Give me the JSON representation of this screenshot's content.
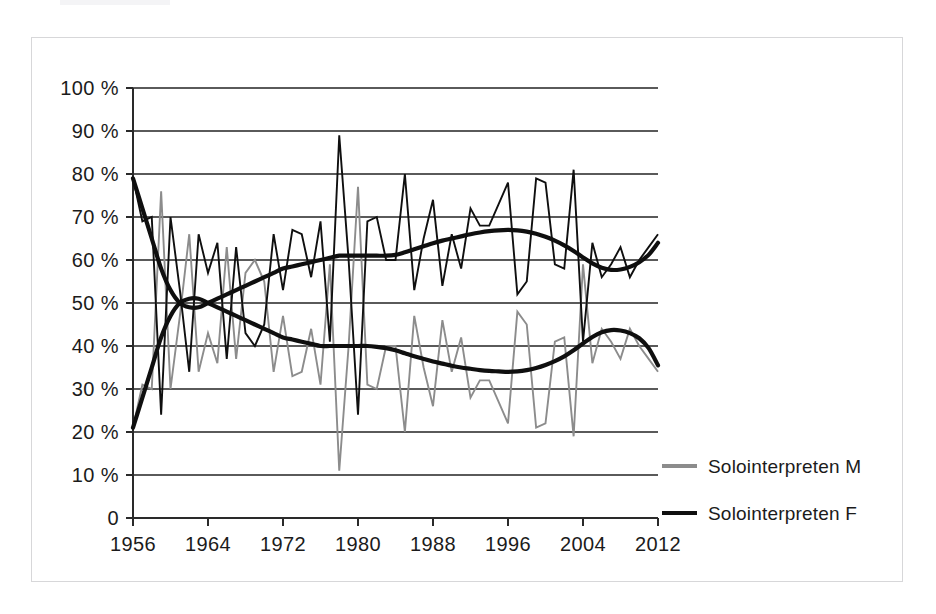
{
  "figure": {
    "kind": "line-chart",
    "background": "#ffffff",
    "frame_color": "#d7d7d9"
  },
  "chart_data": {
    "type": "line",
    "title": "",
    "subtitle": "",
    "xlabel": "",
    "ylabel": "",
    "xlim": [
      1956,
      2012
    ],
    "ylim": [
      0,
      100
    ],
    "grid": true,
    "legend_position": "right",
    "x_tick_labels": [
      "1956",
      "1964",
      "1972",
      "1980",
      "1988",
      "1996",
      "2004",
      "2012"
    ],
    "x_tick_values": [
      1956,
      1964,
      1972,
      1980,
      1988,
      1996,
      2004,
      2012
    ],
    "y_tick_labels": [
      "100 %",
      "90 %",
      "80 %",
      "70 %",
      "60 %",
      "50 %",
      "40 %",
      "30 %",
      "20 %",
      "10 %",
      "0"
    ],
    "y_tick_values": [
      100,
      90,
      80,
      70,
      60,
      50,
      40,
      30,
      20,
      10,
      0
    ],
    "x": [
      1956,
      1957,
      1958,
      1959,
      1960,
      1961,
      1962,
      1963,
      1964,
      1965,
      1966,
      1967,
      1968,
      1969,
      1970,
      1971,
      1972,
      1973,
      1974,
      1975,
      1976,
      1977,
      1978,
      1979,
      1980,
      1981,
      1982,
      1983,
      1984,
      1985,
      1986,
      1987,
      1988,
      1989,
      1990,
      1991,
      1992,
      1993,
      1994,
      1995,
      1996,
      1997,
      1998,
      1999,
      2000,
      2001,
      2002,
      2003,
      2004,
      2005,
      2006,
      2007,
      2008,
      2009,
      2010,
      2011,
      2012
    ],
    "series": [
      {
        "name": "Solointerpreten M",
        "color": "#8c8c8c",
        "style": "raw",
        "values": [
          21,
          31,
          30,
          76,
          30,
          47,
          66,
          34,
          43,
          36,
          63,
          37,
          57,
          60,
          55,
          34,
          47,
          33,
          34,
          44,
          31,
          59,
          11,
          40,
          77,
          31,
          30,
          40,
          40,
          20,
          47,
          35,
          26,
          46,
          34,
          42,
          28,
          32,
          32,
          27,
          22,
          48,
          45,
          21,
          22,
          41,
          42,
          19,
          59,
          36,
          44,
          41,
          37,
          44,
          40,
          37,
          34
        ]
      },
      {
        "name": "Solointerpreten F",
        "color": "#0f0f0f",
        "style": "raw",
        "values": [
          79,
          69,
          70,
          24,
          70,
          53,
          34,
          66,
          57,
          64,
          37,
          63,
          43,
          40,
          45,
          66,
          53,
          67,
          66,
          56,
          69,
          41,
          89,
          60,
          24,
          69,
          70,
          60,
          60,
          80,
          53,
          65,
          74,
          54,
          66,
          58,
          72,
          68,
          68,
          73,
          78,
          52,
          55,
          79,
          78,
          59,
          58,
          81,
          41,
          64,
          56,
          59,
          63,
          56,
          60,
          63,
          66
        ]
      },
      {
        "name": "Solointerpreten M trend",
        "color": "#0f0f0f",
        "style": "trend",
        "values": [
          21,
          28,
          35,
          42,
          47,
          50,
          51,
          51,
          50,
          49,
          48,
          47,
          46,
          45,
          44,
          43,
          42,
          41.5,
          41,
          40.5,
          40,
          40,
          40,
          40,
          40,
          40,
          39.8,
          39.5,
          39,
          38.3,
          37.6,
          37,
          36.4,
          35.9,
          35.4,
          35,
          34.7,
          34.4,
          34.2,
          34.1,
          34,
          34.1,
          34.4,
          34.9,
          35.6,
          36.5,
          37.6,
          39,
          40.6,
          42.1,
          43.2,
          43.7,
          43.6,
          43,
          41.8,
          39.5,
          35.5
        ]
      },
      {
        "name": "Solointerpreten F trend",
        "color": "#0f0f0f",
        "style": "trend",
        "values": [
          79,
          72,
          65,
          58,
          53,
          50,
          49,
          49,
          50,
          51,
          52,
          53,
          54,
          55,
          56,
          57,
          58,
          58.5,
          59,
          59.5,
          60,
          60.5,
          61,
          61,
          61,
          61,
          61,
          61,
          61.2,
          61.8,
          62.5,
          63.2,
          63.9,
          64.5,
          65,
          65.5,
          66,
          66.4,
          66.7,
          66.9,
          67,
          66.9,
          66.6,
          66.1,
          65.4,
          64.5,
          63.4,
          62.1,
          60.6,
          59.2,
          58.2,
          57.7,
          57.8,
          58.4,
          59.5,
          61.2,
          64
        ]
      }
    ],
    "legend_entries": [
      {
        "label": "Solointerpreten M",
        "color": "#8c8c8c"
      },
      {
        "label": "Solointerpreten F",
        "color": "#0f0f0f"
      }
    ]
  }
}
